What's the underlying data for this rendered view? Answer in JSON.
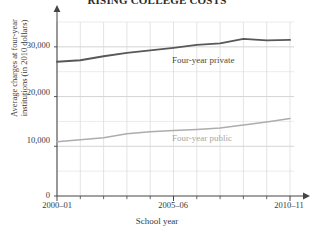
{
  "chart_data": {
    "type": "line",
    "title": "RISING COLLEGE COSTS",
    "xlabel": "School year",
    "ylabel_line1": "Average charges at four-year",
    "ylabel_line2": "institutions (in 2010 dollars)",
    "x": [
      "2000–01",
      "2001–02",
      "2002–03",
      "2003–04",
      "2004–05",
      "2005–06",
      "2006–07",
      "2007–08",
      "2008–09",
      "2009–10",
      "2010–11"
    ],
    "xtick_labels": [
      "2000–01",
      "2005–06",
      "2010–11"
    ],
    "xtick_indices": [
      0,
      5,
      10
    ],
    "ytick_labels": [
      "0",
      "10,000",
      "20,000",
      "30,000"
    ],
    "ytick_values": [
      0,
      10000,
      20000,
      30000
    ],
    "ylim": [
      0,
      35000
    ],
    "y_minor_step": 5000,
    "grid": true,
    "legend_position": "inline-annotation",
    "series": [
      {
        "name": "Four-year private",
        "color": "#585858",
        "label_color": "#4a4a4a",
        "values": [
          27000,
          27300,
          28100,
          28800,
          29300,
          29800,
          30400,
          30700,
          31600,
          31300,
          31400
        ]
      },
      {
        "name": "Four-year public",
        "color": "#adadad",
        "label_color": "#a6a6a6",
        "values": [
          10900,
          11300,
          11700,
          12500,
          12900,
          13200,
          13400,
          13700,
          14300,
          14900,
          15600
        ]
      }
    ]
  },
  "axes": {
    "y_arrow": "up-arrow-icon",
    "x_arrow": "right-arrow-icon"
  }
}
